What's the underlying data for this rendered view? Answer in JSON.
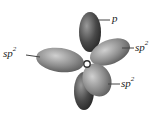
{
  "diagram": {
    "center_atom": "O",
    "labels": {
      "p": {
        "base": "p",
        "sup": ""
      },
      "sp2_left": {
        "base": "sp",
        "sup": "2"
      },
      "sp2_right_upper": {
        "base": "sp",
        "sup": "2"
      },
      "sp2_right_lower": {
        "base": "sp",
        "sup": "2"
      }
    },
    "colors": {
      "lobe_dark": "#3a3a3a",
      "lobe_mid": "#7a7a7a",
      "lobe_light": "#b5b5b5",
      "leader_line": "#444444",
      "text": "#222222"
    }
  }
}
